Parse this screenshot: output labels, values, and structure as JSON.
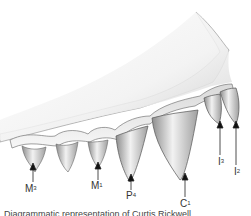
{
  "figure": {
    "caption": "Diagrammatic representation of Curtis Rickwell"
  },
  "labels": [
    {
      "id": "m3",
      "base": "M",
      "sup": "3",
      "x": 25,
      "y": 184
    },
    {
      "id": "m1",
      "base": "M",
      "sup": "1",
      "x": 91,
      "y": 181
    },
    {
      "id": "p4",
      "base": "P",
      "sup": "4",
      "x": 129,
      "y": 191
    },
    {
      "id": "c1",
      "base": "C",
      "sup": "1",
      "x": 182,
      "y": 199
    },
    {
      "id": "i3",
      "base": "I",
      "sup": "3",
      "x": 217,
      "y": 157
    },
    {
      "id": "i2",
      "base": "I",
      "sup": "2",
      "x": 233,
      "y": 167
    }
  ],
  "colors": {
    "ink": "#333333",
    "shade": "#9a9a9a",
    "light": "#e6e6e6"
  }
}
